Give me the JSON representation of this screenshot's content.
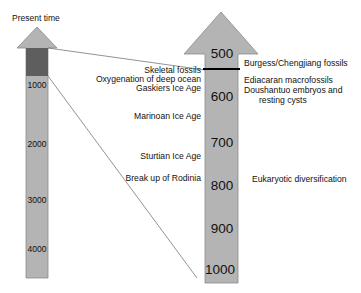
{
  "left_arrow": {
    "title": "Present time",
    "ticks": [
      "1000",
      "2000",
      "3000",
      "4000"
    ],
    "highlight_color": "#5e5e5e",
    "fill_color": "#b4b4b4"
  },
  "right_arrow": {
    "ticks": [
      "500",
      "600",
      "700",
      "800",
      "900",
      "1000"
    ],
    "fill_color": "#b4b4b4",
    "marker_line_color": "#000000"
  },
  "left_events": [
    "Skeletal fossils",
    "Oxygenation of deep ocean",
    "Gaskiers Ice Age",
    "Marinoan Ice Age",
    "Sturtian Ice Age",
    "Break up of Rodinia"
  ],
  "right_events": [
    "Burgess/Chengjiang fossils",
    "Ediacaran macrofossils",
    "Doushantuo embryos and",
    "resting cysts",
    "Eukaryotic diversification"
  ]
}
